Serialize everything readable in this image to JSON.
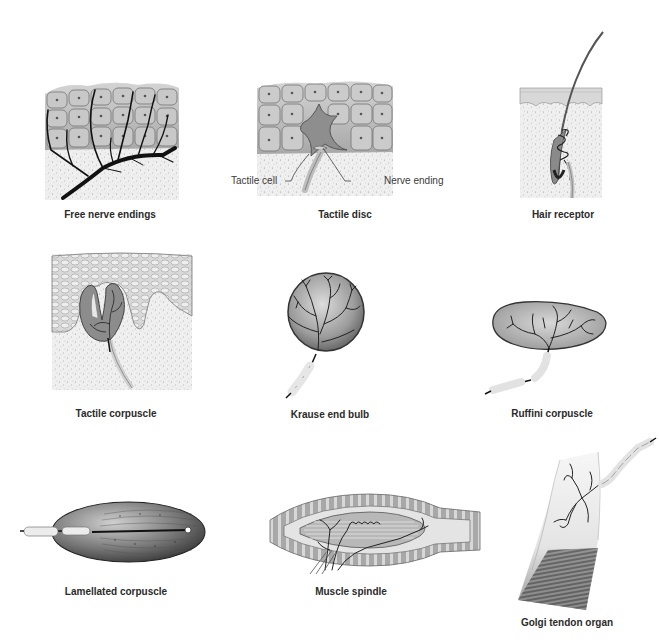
{
  "figure": {
    "panels": [
      {
        "id": "free-nerve-endings",
        "caption": "Free nerve endings"
      },
      {
        "id": "tactile-disc",
        "caption": "Tactile disc",
        "callouts": [
          "Tactile cell",
          "Nerve ending"
        ]
      },
      {
        "id": "hair-receptor",
        "caption": "Hair receptor"
      },
      {
        "id": "tactile-corpuscle",
        "caption": "Tactile corpuscle"
      },
      {
        "id": "krause-end-bulb",
        "caption": "Krause end bulb"
      },
      {
        "id": "ruffini-corpuscle",
        "caption": "Ruffini corpuscle"
      },
      {
        "id": "lamellated-corpuscle",
        "caption": "Lamellated corpuscle"
      },
      {
        "id": "muscle-spindle",
        "caption": "Muscle spindle"
      },
      {
        "id": "golgi-tendon-organ",
        "caption": "Golgi tendon organ"
      }
    ],
    "colors": {
      "background": "#ffffff",
      "tissue": "#e9e9e9",
      "cell_fill": "#bdbdbd",
      "nerve": "#1a1a1a",
      "caption": "#2a2a2a"
    }
  }
}
